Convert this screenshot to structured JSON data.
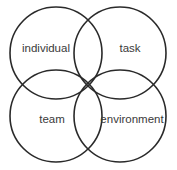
{
  "diagram": {
    "type": "four-circle venn",
    "stroke_color": "#2a2a2a",
    "text_color": "#3a3a3a",
    "circles": [
      {
        "label": "individual",
        "position": "top-left"
      },
      {
        "label": "task",
        "position": "top-right"
      },
      {
        "label": "team",
        "position": "bottom-left"
      },
      {
        "label": "environment",
        "position": "bottom-right"
      }
    ]
  }
}
